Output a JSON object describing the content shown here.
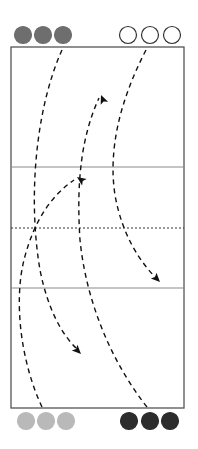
{
  "diagram": {
    "type": "volleyball-court-drill",
    "court": {
      "x": 11,
      "y": 47,
      "width": 173,
      "height": 361,
      "border_color": "#555555",
      "attack_line_top_y": 167,
      "center_line_y": 228,
      "attack_line_bottom_y": 288,
      "line_color": "#8a8a8a",
      "center_line_style": "dotted"
    },
    "teams": [
      {
        "name": "top-left-team",
        "fill": "#6e6e6e",
        "stroke": "#6e6e6e",
        "players": [
          {
            "cx": 23,
            "cy": 35
          },
          {
            "cx": 43,
            "cy": 35
          },
          {
            "cx": 63,
            "cy": 35
          }
        ]
      },
      {
        "name": "top-right-team",
        "fill": "#ffffff",
        "stroke": "#333333",
        "players": [
          {
            "cx": 128,
            "cy": 35
          },
          {
            "cx": 150,
            "cy": 35
          },
          {
            "cx": 172,
            "cy": 35
          }
        ]
      },
      {
        "name": "bottom-left-team",
        "fill": "#b9b9b9",
        "stroke": "#b9b9b9",
        "players": [
          {
            "cx": 26,
            "cy": 421
          },
          {
            "cx": 46,
            "cy": 421
          },
          {
            "cx": 66,
            "cy": 421
          }
        ]
      },
      {
        "name": "bottom-right-team",
        "fill": "#2c2c2c",
        "stroke": "#2c2c2c",
        "players": [
          {
            "cx": 129,
            "cy": 421
          },
          {
            "cx": 150,
            "cy": 421
          },
          {
            "cx": 170,
            "cy": 421
          }
        ]
      }
    ],
    "paths": [
      {
        "name": "path-top-left-to-bottom",
        "d": "M62,50 C35,110 28,200 40,270 C48,310 62,335 78,350"
      },
      {
        "name": "path-top-right-to-center",
        "d": "M146,50 C120,100 108,150 115,195 C122,235 140,262 157,279"
      },
      {
        "name": "path-bottom-left-to-top",
        "d": "M42,407 C20,360 14,300 24,260 C34,220 52,195 74,180"
      },
      {
        "name": "path-bottom-right-to-top",
        "d": "M147,407 C110,360 86,300 80,240 C76,180 82,135 99,98"
      }
    ],
    "arrowheads": [
      {
        "name": "arrowhead-down-left",
        "tip_x": 81,
        "tip_y": 354,
        "angle": 45
      },
      {
        "name": "arrowhead-down-right",
        "tip_x": 160,
        "tip_y": 282,
        "angle": 45
      },
      {
        "name": "arrowhead-up-left",
        "tip_x": 77,
        "tip_y": 177,
        "angle": -145
      },
      {
        "name": "arrowhead-up-right",
        "tip_x": 101,
        "tip_y": 95,
        "angle": -112
      }
    ],
    "dash_color": "#111111"
  }
}
